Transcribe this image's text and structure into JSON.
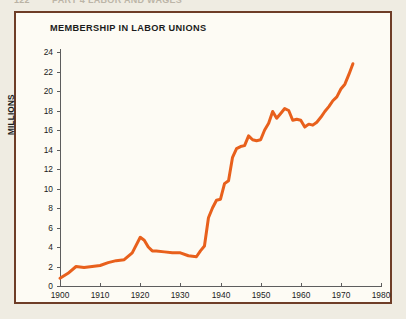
{
  "page_header": {
    "folio": "122",
    "running_head": "PART 4   LABOR AND WAGES"
  },
  "figure": {
    "title": "MEMBERSHIP IN LABOR UNIONS",
    "frame_color": "#6e3d27",
    "paper_color": "#fdfbf4"
  },
  "chart_data": {
    "type": "line",
    "title": "MEMBERSHIP IN LABOR UNIONS",
    "xlabel": "",
    "ylabel": "MILLIONS",
    "xlim": [
      1900,
      1980
    ],
    "ylim": [
      0,
      24
    ],
    "grid": false,
    "legend": null,
    "line_color": "#e8601c",
    "line_width": 3,
    "x_ticks": [
      1900,
      1910,
      1920,
      1930,
      1940,
      1950,
      1960,
      1970,
      1980
    ],
    "y_ticks": [
      0,
      2,
      4,
      6,
      8,
      10,
      12,
      14,
      16,
      18,
      20,
      22,
      24
    ],
    "series": [
      {
        "name": "Union membership",
        "x": [
          1900,
          1902,
          1904,
          1906,
          1908,
          1910,
          1912,
          1914,
          1916,
          1918,
          1920,
          1921,
          1922,
          1923,
          1924,
          1926,
          1928,
          1930,
          1932,
          1934,
          1935,
          1936,
          1937,
          1938,
          1939,
          1940,
          1941,
          1942,
          1943,
          1944,
          1945,
          1946,
          1947,
          1948,
          1949,
          1950,
          1951,
          1952,
          1953,
          1954,
          1955,
          1956,
          1957,
          1958,
          1959,
          1960,
          1961,
          1962,
          1963,
          1964,
          1965,
          1966,
          1967,
          1968,
          1969,
          1970,
          1971,
          1972,
          1973
        ],
        "values": [
          0.8,
          1.3,
          2.0,
          1.9,
          2.0,
          2.1,
          2.4,
          2.6,
          2.7,
          3.4,
          5.0,
          4.7,
          4.0,
          3.6,
          3.6,
          3.5,
          3.4,
          3.4,
          3.1,
          3.0,
          3.6,
          4.1,
          7.0,
          8.0,
          8.8,
          8.9,
          10.5,
          10.8,
          13.2,
          14.1,
          14.3,
          14.4,
          15.4,
          15.0,
          14.9,
          15.0,
          16.0,
          16.7,
          17.9,
          17.2,
          17.7,
          18.2,
          18.0,
          17.0,
          17.1,
          17.0,
          16.3,
          16.6,
          16.5,
          16.8,
          17.3,
          17.9,
          18.4,
          19.0,
          19.4,
          20.2,
          20.7,
          21.7,
          22.8
        ]
      }
    ]
  }
}
